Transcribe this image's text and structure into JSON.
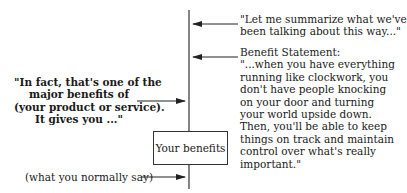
{
  "diagram": {
    "summary_quote": [
      "\"Let me summarize what we've",
      "been talking about this way...\""
    ],
    "benefit_statement": {
      "heading": "Benefit Statement:",
      "lines": [
        "\"...when you have everything",
        "running like clockwork, you",
        "don't have people knocking",
        "on your door and turning",
        "your world upside down.",
        "Then, you'll be able to keep",
        "things on track and maintain",
        "control over what's really",
        "important.\""
      ]
    },
    "left_quote": [
      "\"In fact, that's one of  the",
      "major benefits of",
      "(your product or service).",
      "It gives you ...\""
    ],
    "box_label": "Your benefits",
    "bottom_label": "(what you normally say)",
    "colors": {
      "line": "#333333",
      "text": "#1a1a1a"
    }
  }
}
